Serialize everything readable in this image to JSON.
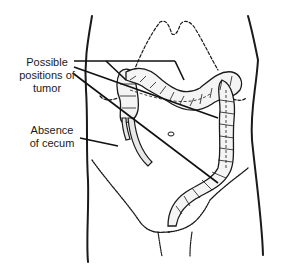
{
  "diagram": {
    "labels": {
      "tumor_line1": "Possible",
      "tumor_line2": "positions of",
      "tumor_line3": "tumor",
      "cecum_line1": "Absence",
      "cecum_line2": "of cecum"
    },
    "colors": {
      "ink": "#1a1a1a",
      "background": "#ffffff",
      "bowel_fill": "#f2f2f2"
    }
  }
}
